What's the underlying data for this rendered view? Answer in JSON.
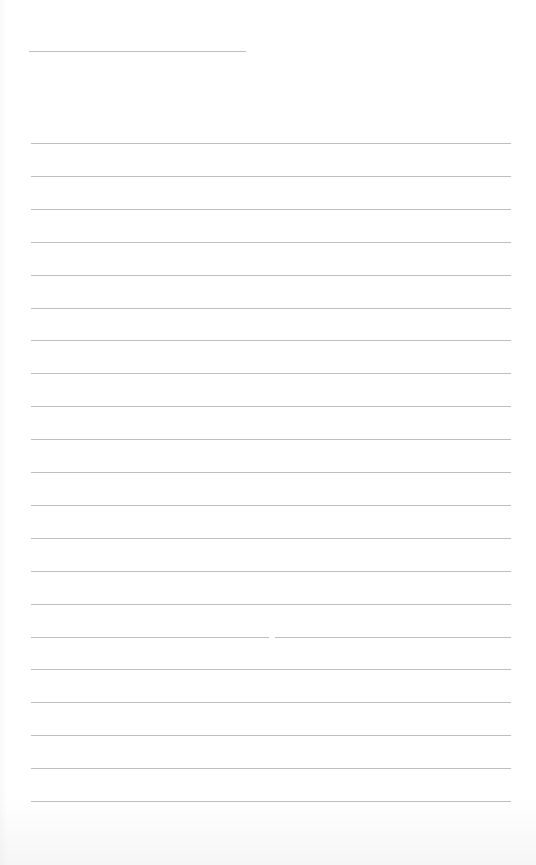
{
  "document": {
    "type": "lined-paper",
    "header_line": {
      "label": "",
      "text": ""
    },
    "line_count": 21,
    "lines": [
      {
        "text": ""
      },
      {
        "text": ""
      },
      {
        "text": ""
      },
      {
        "text": ""
      },
      {
        "text": ""
      },
      {
        "text": ""
      },
      {
        "text": ""
      },
      {
        "text": ""
      },
      {
        "text": ""
      },
      {
        "text": ""
      },
      {
        "text": ""
      },
      {
        "text": ""
      },
      {
        "text": ""
      },
      {
        "text": ""
      },
      {
        "text": ""
      },
      {
        "text": ""
      },
      {
        "text": ""
      },
      {
        "text": ""
      },
      {
        "text": ""
      },
      {
        "text": ""
      },
      {
        "text": ""
      }
    ],
    "colors": {
      "paper": "#ffffff",
      "rule": "#b4b4b4"
    }
  }
}
